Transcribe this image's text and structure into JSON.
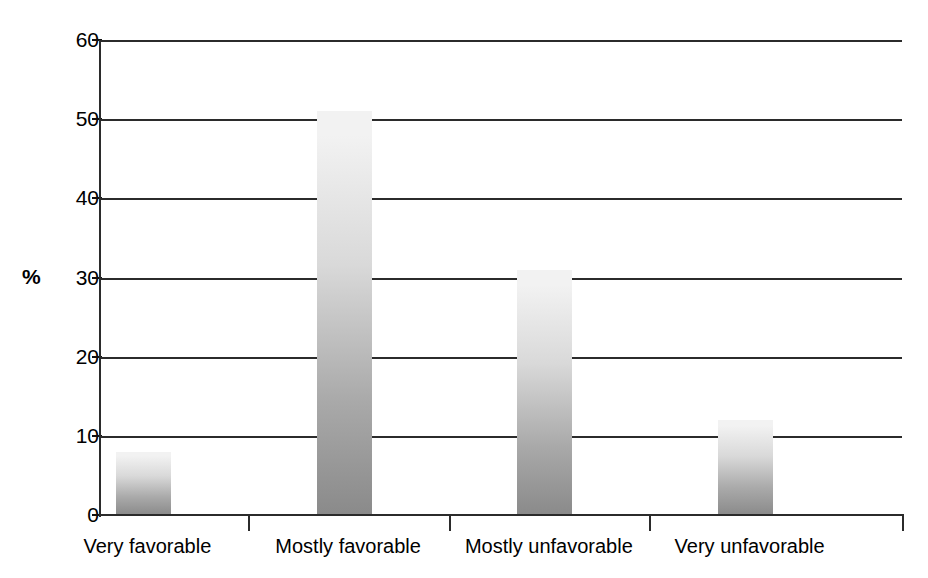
{
  "chart_data": {
    "type": "bar",
    "title": "",
    "subtitle": "",
    "xlabel": "",
    "ylabel": "%",
    "categories": [
      "Very favorable",
      "Mostly favorable",
      "Mostly unfavorable",
      "Very unfavorable"
    ],
    "values": [
      8,
      51,
      31,
      12
    ],
    "series": [
      {
        "name": "",
        "values": [
          8,
          51,
          31,
          12
        ]
      }
    ],
    "ylim": [
      0,
      60
    ],
    "ytick_labels": [
      "0",
      "10",
      "20",
      "30",
      "40",
      "50",
      "60"
    ],
    "ytick_values": [
      0,
      10,
      20,
      30,
      40,
      50,
      60
    ],
    "grid": true,
    "grid_axis": "y",
    "legend": false,
    "legend_position": "none",
    "annotations": [],
    "bar_style": "vertical-gradient-light-top-dark-bottom",
    "colors": {
      "bar_top": "#f2f2f2",
      "bar_bottom": "#8a8a8a",
      "axis": "#2b2b2b",
      "grid": "#2b2b2b",
      "background": "#ffffff",
      "text": "#000000"
    }
  },
  "axis": {
    "unit_label": "%",
    "ticks": [
      {
        "label": "60",
        "value": 60
      },
      {
        "label": "50",
        "value": 50
      },
      {
        "label": "40",
        "value": 40
      },
      {
        "label": "30",
        "value": 30
      },
      {
        "label": "20",
        "value": 20
      },
      {
        "label": "10",
        "value": 10
      },
      {
        "label": "0",
        "value": 0
      }
    ]
  },
  "bars": [
    {
      "label": "Very favorable",
      "value": 8
    },
    {
      "label": "Mostly favorable",
      "value": 51
    },
    {
      "label": "Mostly unfavorable",
      "value": 31
    },
    {
      "label": "Very unfavorable",
      "value": 12
    }
  ]
}
